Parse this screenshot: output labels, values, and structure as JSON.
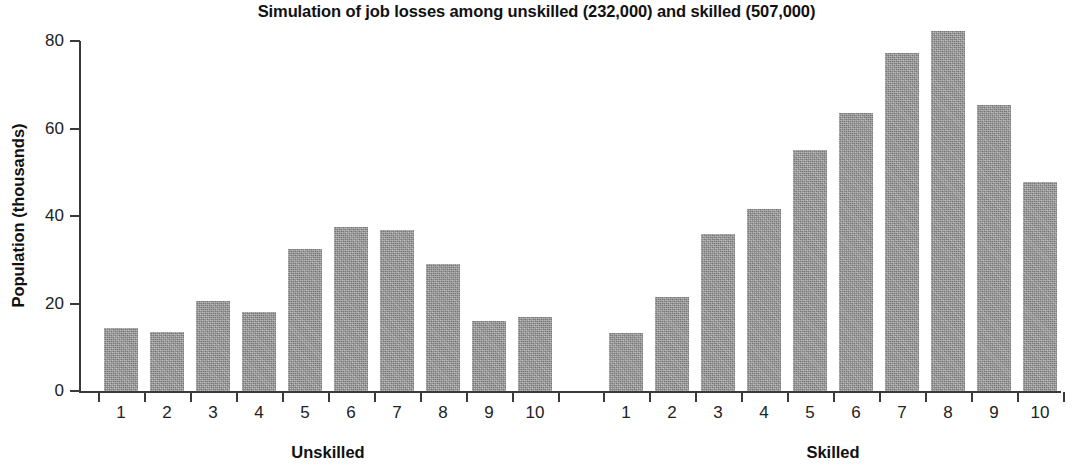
{
  "chart_data": {
    "type": "bar",
    "title": "Simulation of job losses among unskilled (232,000) and skilled (507,000)",
    "xlabel": "",
    "ylabel": "Population (thousands)",
    "ylim": [
      0,
      80
    ],
    "yticks": [
      0,
      20,
      40,
      60,
      80
    ],
    "ytick_labels": [
      "0",
      "20",
      "40",
      "60",
      "80"
    ],
    "grid": false,
    "legend": "none",
    "groups": [
      {
        "name": "Unskilled",
        "label": "Unskilled",
        "categories": [
          "1",
          "2",
          "3",
          "4",
          "5",
          "6",
          "7",
          "8",
          "9",
          "10"
        ],
        "values": [
          14.3,
          13.6,
          20.5,
          18.0,
          32.4,
          37.4,
          36.8,
          29.0,
          16.0,
          17.0
        ]
      },
      {
        "name": "Skilled",
        "label": "Skilled",
        "categories": [
          "1",
          "2",
          "3",
          "4",
          "5",
          "6",
          "7",
          "8",
          "9",
          "10"
        ],
        "values": [
          13.2,
          21.6,
          35.9,
          41.6,
          55.1,
          63.5,
          77.3,
          82.3,
          65.4,
          47.8
        ]
      }
    ],
    "bar_color": "#9d9d9d",
    "axis_color": "#3a3a3a",
    "text_color": "#111111"
  }
}
